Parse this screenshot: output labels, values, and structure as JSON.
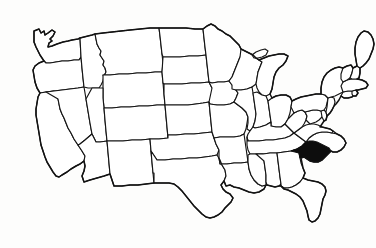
{
  "document": {
    "type": "map-illustration",
    "title": "Map of the contiguous United States",
    "caption": "",
    "background_color": "#fdfdfc",
    "stroke_color": "#141414",
    "fill_color": "#ffffff",
    "highlight_color": "#0d0d0d",
    "width": 376,
    "height": 248
  },
  "map": {
    "region": "Contiguous United States",
    "projection_note": "simplified outline",
    "state_borders_visible": true,
    "labels_visible": false,
    "highlighted_states": [
      "South Carolina"
    ],
    "highlight_style": "solid black fill",
    "states": [
      {
        "code": "WA",
        "name": "Washington",
        "highlighted": false
      },
      {
        "code": "OR",
        "name": "Oregon",
        "highlighted": false
      },
      {
        "code": "CA",
        "name": "California",
        "highlighted": false
      },
      {
        "code": "NV",
        "name": "Nevada",
        "highlighted": false
      },
      {
        "code": "ID",
        "name": "Idaho",
        "highlighted": false
      },
      {
        "code": "MT",
        "name": "Montana",
        "highlighted": false
      },
      {
        "code": "WY",
        "name": "Wyoming",
        "highlighted": false
      },
      {
        "code": "UT",
        "name": "Utah",
        "highlighted": false
      },
      {
        "code": "AZ",
        "name": "Arizona",
        "highlighted": false
      },
      {
        "code": "CO",
        "name": "Colorado",
        "highlighted": false
      },
      {
        "code": "NM",
        "name": "New Mexico",
        "highlighted": false
      },
      {
        "code": "ND",
        "name": "North Dakota",
        "highlighted": false
      },
      {
        "code": "SD",
        "name": "South Dakota",
        "highlighted": false
      },
      {
        "code": "NE",
        "name": "Nebraska",
        "highlighted": false
      },
      {
        "code": "KS",
        "name": "Kansas",
        "highlighted": false
      },
      {
        "code": "OK",
        "name": "Oklahoma",
        "highlighted": false
      },
      {
        "code": "TX",
        "name": "Texas",
        "highlighted": false
      },
      {
        "code": "MN",
        "name": "Minnesota",
        "highlighted": false
      },
      {
        "code": "IA",
        "name": "Iowa",
        "highlighted": false
      },
      {
        "code": "MO",
        "name": "Missouri",
        "highlighted": false
      },
      {
        "code": "AR",
        "name": "Arkansas",
        "highlighted": false
      },
      {
        "code": "LA",
        "name": "Louisiana",
        "highlighted": false
      },
      {
        "code": "WI",
        "name": "Wisconsin",
        "highlighted": false
      },
      {
        "code": "IL",
        "name": "Illinois",
        "highlighted": false
      },
      {
        "code": "MI",
        "name": "Michigan",
        "highlighted": false
      },
      {
        "code": "IN",
        "name": "Indiana",
        "highlighted": false
      },
      {
        "code": "OH",
        "name": "Ohio",
        "highlighted": false
      },
      {
        "code": "KY",
        "name": "Kentucky",
        "highlighted": false
      },
      {
        "code": "TN",
        "name": "Tennessee",
        "highlighted": false
      },
      {
        "code": "MS",
        "name": "Mississippi",
        "highlighted": false
      },
      {
        "code": "AL",
        "name": "Alabama",
        "highlighted": false
      },
      {
        "code": "GA",
        "name": "Georgia",
        "highlighted": false
      },
      {
        "code": "FL",
        "name": "Florida",
        "highlighted": false
      },
      {
        "code": "SC",
        "name": "South Carolina",
        "highlighted": true
      },
      {
        "code": "NC",
        "name": "North Carolina",
        "highlighted": false
      },
      {
        "code": "VA",
        "name": "Virginia",
        "highlighted": false
      },
      {
        "code": "WV",
        "name": "West Virginia",
        "highlighted": false
      },
      {
        "code": "MD",
        "name": "Maryland",
        "highlighted": false
      },
      {
        "code": "DE",
        "name": "Delaware",
        "highlighted": false
      },
      {
        "code": "PA",
        "name": "Pennsylvania",
        "highlighted": false
      },
      {
        "code": "NJ",
        "name": "New Jersey",
        "highlighted": false
      },
      {
        "code": "NY",
        "name": "New York",
        "highlighted": false
      },
      {
        "code": "CT",
        "name": "Connecticut",
        "highlighted": false
      },
      {
        "code": "RI",
        "name": "Rhode Island",
        "highlighted": false
      },
      {
        "code": "MA",
        "name": "Massachusetts",
        "highlighted": false
      },
      {
        "code": "VT",
        "name": "Vermont",
        "highlighted": false
      },
      {
        "code": "NH",
        "name": "New Hampshire",
        "highlighted": false
      },
      {
        "code": "ME",
        "name": "Maine",
        "highlighted": false
      }
    ]
  }
}
